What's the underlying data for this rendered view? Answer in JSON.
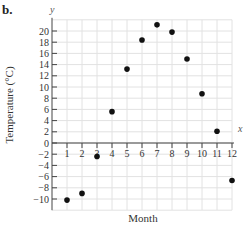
{
  "panel_label": "b.",
  "chart_data": {
    "type": "scatter",
    "title": "",
    "xlabel": "Month",
    "ylabel": "Temperature (°C)",
    "x_axis_var": "x",
    "y_axis_var": "y",
    "x": [
      1,
      2,
      3,
      4,
      5,
      6,
      7,
      8,
      9,
      10,
      11,
      12
    ],
    "values": [
      -10.2,
      -9.0,
      -2.4,
      5.6,
      13.2,
      18.4,
      21.1,
      19.8,
      15.0,
      8.8,
      2.1,
      -6.7
    ],
    "xlim": [
      0,
      12
    ],
    "ylim": [
      -12,
      22
    ],
    "x_ticks": [
      1,
      2,
      3,
      4,
      5,
      6,
      7,
      8,
      9,
      10,
      11,
      12
    ],
    "y_ticks": [
      20,
      18,
      16,
      14,
      12,
      10,
      8,
      6,
      4,
      2,
      0,
      -2,
      -4,
      -6,
      -8,
      -10
    ],
    "grid": true,
    "legend": null
  }
}
